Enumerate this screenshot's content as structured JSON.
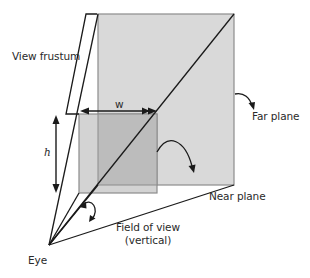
{
  "diagram": {
    "type": "view-frustum-illustration",
    "labels": {
      "view_frustum": "View frustum",
      "width": "w",
      "height": "h",
      "far_plane": "Far plane",
      "near_plane": "Near plane",
      "fov_line1": "Field of view",
      "fov_line2": "(vertical)",
      "eye": "Eye"
    },
    "colors": {
      "far_plane_fill": "#d9d9d9",
      "near_plane_fill": "#cfcfcf",
      "overlap_fill": "#b8b8b8",
      "plane_edge": "#8c8c8c",
      "line": "#1a1a1a",
      "background": "#ffffff"
    },
    "geometry": {
      "eye": [
        49,
        245
      ],
      "far_plane": {
        "x1": 98,
        "y1": 14,
        "x2": 234,
        "y2": 185
      },
      "near_plane": {
        "x1": 79,
        "y1": 114,
        "x2": 157,
        "y2": 193
      }
    }
  }
}
